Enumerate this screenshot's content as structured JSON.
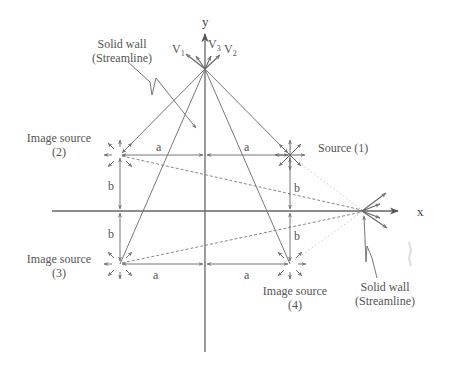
{
  "diagram": {
    "type": "method-of-images source flow between walls",
    "colors": {
      "line": "#777777",
      "axis": "#666666",
      "text": "#555555",
      "dashed": "#888888",
      "dotted": "#bbbbbb"
    },
    "axes": {
      "x_label": "x",
      "y_label": "y"
    },
    "velocity_labels": {
      "v1": "V",
      "v1_sub": "1",
      "v3": "V",
      "v3_sub": "3",
      "v2": "V",
      "v2_sub": "2"
    },
    "top_wall": {
      "line1": "Solid wall",
      "line2": "(Streamline)"
    },
    "right_wall": {
      "line1": "Solid wall",
      "line2": "(Streamline)"
    },
    "sources": [
      {
        "id": 1,
        "label": "Source (1)",
        "kind": "source",
        "x": 290,
        "y": 155
      },
      {
        "id": 2,
        "label_line1": "Image source",
        "label_line2": "(2)",
        "kind": "image",
        "x": 120,
        "y": 155
      },
      {
        "id": 3,
        "label_line1": "Image source",
        "label_line2": "(3)",
        "kind": "image",
        "x": 120,
        "y": 264
      },
      {
        "id": 4,
        "label_line1": "Image source",
        "label_line2": "(4)",
        "kind": "image",
        "x": 290,
        "y": 264
      }
    ],
    "dimensions": {
      "a_top_left": "a",
      "a_top_right": "a",
      "a_bottom_left": "a",
      "a_bottom_right": "a",
      "b_left_upper": "b",
      "b_left_lower": "b",
      "b_right_upper": "b",
      "b_right_lower": "b"
    }
  }
}
